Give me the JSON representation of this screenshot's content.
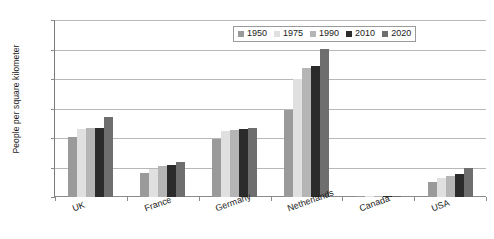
{
  "chart_data": {
    "type": "bar",
    "title": "",
    "xlabel": "",
    "ylabel": "People per square kilometer",
    "ylim": [
      0,
      600
    ],
    "yticks": [
      0,
      100,
      200,
      300,
      400,
      500,
      600
    ],
    "grid": true,
    "legend_position": "top-right-inside",
    "categories": [
      "UK",
      "France",
      "Germany",
      "Netherlands",
      "Canada",
      "USA"
    ],
    "series": [
      {
        "name": "1950",
        "color": "#9a9a9a",
        "values": [
          205,
          80,
          197,
          296,
          2,
          50
        ]
      },
      {
        "name": "1975",
        "color": "#e0e0e0",
        "values": [
          230,
          95,
          223,
          400,
          3,
          63
        ]
      },
      {
        "name": "1990",
        "color": "#b5b5b5",
        "values": [
          233,
          105,
          228,
          437,
          3,
          70
        ]
      },
      {
        "name": "2010",
        "color": "#2b2b2b",
        "values": [
          235,
          110,
          230,
          443,
          4,
          78
        ]
      },
      {
        "name": "2020",
        "color": "#6e6e6e",
        "values": [
          272,
          120,
          233,
          503,
          4,
          100
        ]
      }
    ]
  },
  "axis": {
    "y_title": "People per square kilometer",
    "y_tick_labels": [
      "600",
      "500",
      "400",
      "300",
      "200",
      "100",
      "0"
    ]
  },
  "legend": {
    "items": [
      {
        "label": "1950"
      },
      {
        "label": "1975"
      },
      {
        "label": "1990"
      },
      {
        "label": "2010"
      },
      {
        "label": "2020"
      }
    ]
  }
}
